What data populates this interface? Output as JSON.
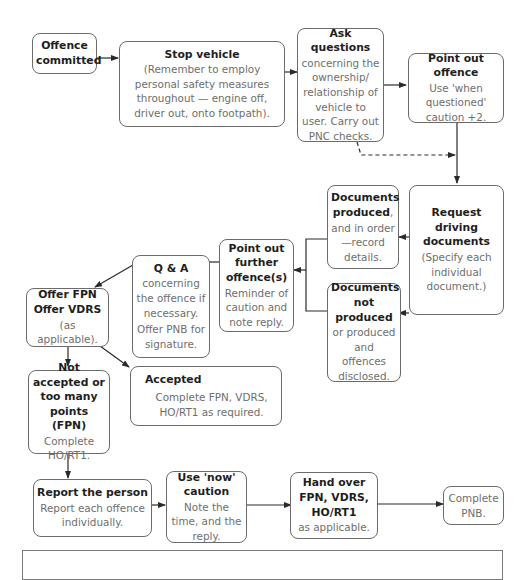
{
  "diagram": {
    "nodes": {
      "offence_committed": {
        "title": "Offence committed",
        "desc": ""
      },
      "stop_vehicle": {
        "title": "Stop vehicle",
        "desc": "(Remember to employ personal safety measures throughout — engine off, driver out, onto footpath)."
      },
      "ask_questions": {
        "title": "Ask questions",
        "desc": "concerning the ownership/ relationship of vehicle to user. Carry out PNC checks."
      },
      "point_out_offence": {
        "title": "Point out offence",
        "desc": "Use 'when questioned' caution +2."
      },
      "request_documents": {
        "title": "Request driving documents",
        "desc": "(Specify each individual document.)"
      },
      "documents_produced": {
        "title": "Documents produced",
        "title_suffix": ",",
        "desc": "and in order —record details."
      },
      "documents_not_produced": {
        "title": "Documents not produced",
        "desc": "or produced and offences disclosed."
      },
      "point_out_further": {
        "title": "Point out further offence(s)",
        "desc": "Reminder of caution and note reply."
      },
      "q_and_a": {
        "title": "Q & A",
        "desc": "concerning the offence if necessary.",
        "desc2": "Offer PNB for signature."
      },
      "offer_fpn": {
        "title": "Offer FPN Offer VDRS",
        "desc": "(as applicable)."
      },
      "accepted": {
        "title": "Accepted",
        "desc": "Complete FPN, VDRS, HO/RT1 as required."
      },
      "not_accepted": {
        "title": "Not accepted or too many points (FPN)",
        "desc": "Complete HO/RT1."
      },
      "report_person": {
        "title": "Report the person",
        "desc": "Report each offence individually."
      },
      "use_now_caution": {
        "title": "Use 'now' caution",
        "desc": "Note the time, and the reply."
      },
      "hand_over": {
        "title": "Hand over FPN, VDRS, HO/RT1",
        "desc": "as applicable."
      },
      "complete_pnb": {
        "title": "",
        "desc": "Complete PNB."
      }
    },
    "edges": [
      {
        "from": "offence_committed",
        "to": "stop_vehicle",
        "style": "solid"
      },
      {
        "from": "stop_vehicle",
        "to": "ask_questions",
        "style": "solid"
      },
      {
        "from": "ask_questions",
        "to": "point_out_offence",
        "style": "solid"
      },
      {
        "from": "ask_questions",
        "to": "request_documents",
        "style": "dashed"
      },
      {
        "from": "point_out_offence",
        "to": "request_documents",
        "style": "solid"
      },
      {
        "from": "request_documents",
        "to": "documents_produced",
        "style": "solid"
      },
      {
        "from": "request_documents",
        "to": "documents_not_produced",
        "style": "solid"
      },
      {
        "from": "documents_produced",
        "to": "point_out_further",
        "style": "solid"
      },
      {
        "from": "documents_not_produced",
        "to": "point_out_further",
        "style": "solid"
      },
      {
        "from": "point_out_further",
        "to": "q_and_a",
        "style": "solid"
      },
      {
        "from": "q_and_a",
        "to": "offer_fpn",
        "style": "solid"
      },
      {
        "from": "offer_fpn",
        "to": "not_accepted",
        "style": "solid"
      },
      {
        "from": "offer_fpn",
        "to": "accepted",
        "style": "solid"
      },
      {
        "from": "not_accepted",
        "to": "report_person",
        "style": "solid"
      },
      {
        "from": "report_person",
        "to": "use_now_caution",
        "style": "solid"
      },
      {
        "from": "use_now_caution",
        "to": "hand_over",
        "style": "solid"
      },
      {
        "from": "hand_over",
        "to": "complete_pnb",
        "style": "solid"
      }
    ],
    "colors": {
      "border": "#6b6b6b",
      "title_text": "#1e1e1e",
      "body_text": "#6e6e6e",
      "line": "#2a2a2a"
    }
  }
}
